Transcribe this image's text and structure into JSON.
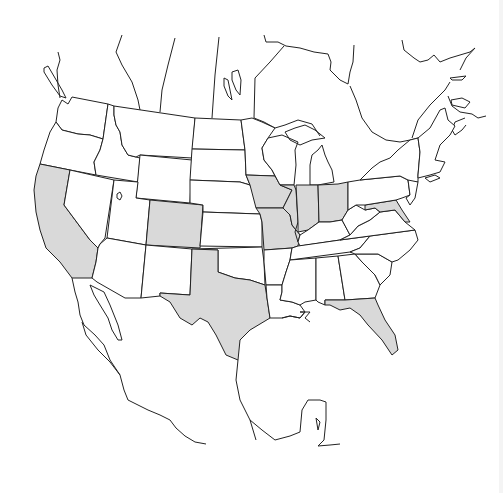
{
  "map": {
    "region": "North America (United States with neighboring Canada and Mexico outlines)",
    "highlight_color": "#d9d9d9",
    "default_fill": "#ffffff",
    "stroke_color": "#222222",
    "highlighted_states": [
      "California",
      "Colorado",
      "Texas",
      "Iowa",
      "Missouri",
      "Illinois",
      "Indiana",
      "Ohio",
      "Maryland",
      "Florida"
    ],
    "states": [
      {
        "name": "Washington",
        "highlighted": false
      },
      {
        "name": "Oregon",
        "highlighted": false
      },
      {
        "name": "California",
        "highlighted": true
      },
      {
        "name": "Idaho",
        "highlighted": false
      },
      {
        "name": "Nevada",
        "highlighted": false
      },
      {
        "name": "Montana",
        "highlighted": false
      },
      {
        "name": "Wyoming",
        "highlighted": false
      },
      {
        "name": "Utah",
        "highlighted": false
      },
      {
        "name": "Arizona",
        "highlighted": false
      },
      {
        "name": "Colorado",
        "highlighted": true
      },
      {
        "name": "New Mexico",
        "highlighted": false
      },
      {
        "name": "North Dakota",
        "highlighted": false
      },
      {
        "name": "South Dakota",
        "highlighted": false
      },
      {
        "name": "Nebraska",
        "highlighted": false
      },
      {
        "name": "Kansas",
        "highlighted": false
      },
      {
        "name": "Oklahoma",
        "highlighted": false
      },
      {
        "name": "Texas",
        "highlighted": true
      },
      {
        "name": "Minnesota",
        "highlighted": false
      },
      {
        "name": "Iowa",
        "highlighted": true
      },
      {
        "name": "Missouri",
        "highlighted": true
      },
      {
        "name": "Arkansas",
        "highlighted": false
      },
      {
        "name": "Louisiana",
        "highlighted": false
      },
      {
        "name": "Wisconsin",
        "highlighted": false
      },
      {
        "name": "Illinois",
        "highlighted": true
      },
      {
        "name": "Michigan",
        "highlighted": false
      },
      {
        "name": "Indiana",
        "highlighted": true
      },
      {
        "name": "Ohio",
        "highlighted": true
      },
      {
        "name": "Kentucky",
        "highlighted": false
      },
      {
        "name": "Tennessee",
        "highlighted": false
      },
      {
        "name": "Mississippi",
        "highlighted": false
      },
      {
        "name": "Alabama",
        "highlighted": false
      },
      {
        "name": "Georgia",
        "highlighted": false
      },
      {
        "name": "Florida",
        "highlighted": true
      },
      {
        "name": "South Carolina",
        "highlighted": false
      },
      {
        "name": "North Carolina",
        "highlighted": false
      },
      {
        "name": "Virginia",
        "highlighted": false
      },
      {
        "name": "West Virginia",
        "highlighted": false
      },
      {
        "name": "Maryland",
        "highlighted": true
      },
      {
        "name": "Pennsylvania",
        "highlighted": false
      },
      {
        "name": "New York",
        "highlighted": false
      },
      {
        "name": "New England",
        "highlighted": false
      }
    ]
  }
}
